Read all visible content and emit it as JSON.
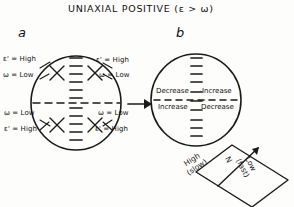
{
  "figure": {
    "title": "UNIAXIAL  POSITIVE  (ε > ω)",
    "panel_a_label": "a",
    "panel_b_label": "b"
  },
  "panel_a": {
    "name": "uniaxial-positive-interference-figure",
    "quadrant_labels": {
      "upper_left_epsilon": "ε' = High",
      "upper_left_omega": "ω = Low",
      "lower_left_omega": "ω = Low",
      "lower_left_epsilon": "ε' = High",
      "upper_right_epsilon": "ε' = High",
      "upper_right_omega": "ω = Low",
      "lower_right_omega": "ω = Low",
      "lower_right_epsilon": "ε' = High"
    }
  },
  "panel_b": {
    "name": "retardation-change-quadrants",
    "upper_left": "Decrease",
    "upper_right": "Increase",
    "lower_left": "Increase",
    "lower_right": "Decrease"
  },
  "accessory_plate": {
    "axis_label": "N",
    "slow_direction": {
      "line1": "High",
      "line2": "(slow)"
    },
    "fast_direction": {
      "line1": "Low",
      "line2": "(fast)"
    }
  },
  "colors": {
    "ink": "#1a1a1a",
    "paper": "#fdfdfb"
  }
}
